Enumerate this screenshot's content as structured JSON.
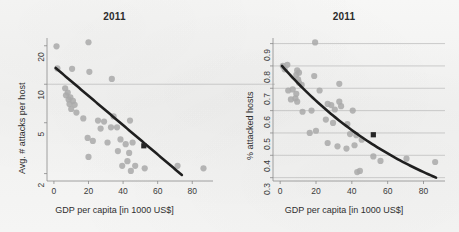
{
  "figure": {
    "width": 459,
    "height": 232,
    "background_color": "#f4f4f3",
    "point_color": "#a9a9a9",
    "line_color": "#1f1f1f",
    "grid_color": "#b9b9b9",
    "axis_color": "#8a8a8a",
    "marker_color": "#262626"
  },
  "chart_data": [
    {
      "panel": "left",
      "type": "scatter",
      "title": "2011",
      "xlabel": "GDP per capita [in 1000 US$]",
      "ylabel": "Avg. # attacks per host",
      "xlim": [
        -4,
        92
      ],
      "ylim": [
        1.75,
        23
      ],
      "yscale": "log",
      "xscale": "linear",
      "xticks": [
        0,
        20,
        40,
        60,
        80
      ],
      "yticks": [
        2,
        5,
        10,
        20
      ],
      "grid": "horizontal-at-10",
      "legend": "none",
      "points": [
        {
          "x": 1.5,
          "y": 19.8
        },
        {
          "x": 20.0,
          "y": 21.3
        },
        {
          "x": 2.0,
          "y": 13.3
        },
        {
          "x": 10.5,
          "y": 13.2
        },
        {
          "x": 20.5,
          "y": 12.5
        },
        {
          "x": 33.5,
          "y": 11.0
        },
        {
          "x": 6.5,
          "y": 9.3
        },
        {
          "x": 8.0,
          "y": 8.6
        },
        {
          "x": 7.0,
          "y": 8.2
        },
        {
          "x": 8.5,
          "y": 7.6
        },
        {
          "x": 9.5,
          "y": 7.9
        },
        {
          "x": 11.0,
          "y": 7.4
        },
        {
          "x": 9.0,
          "y": 7.0
        },
        {
          "x": 12.0,
          "y": 6.9
        },
        {
          "x": 10.0,
          "y": 6.4
        },
        {
          "x": 13.0,
          "y": 6.0
        },
        {
          "x": 17.0,
          "y": 5.4
        },
        {
          "x": 25.5,
          "y": 5.2
        },
        {
          "x": 29.0,
          "y": 5.1
        },
        {
          "x": 34.5,
          "y": 5.6
        },
        {
          "x": 44.0,
          "y": 5.2
        },
        {
          "x": 27.0,
          "y": 4.5
        },
        {
          "x": 33.0,
          "y": 4.6
        },
        {
          "x": 36.5,
          "y": 4.6
        },
        {
          "x": 19.5,
          "y": 3.8
        },
        {
          "x": 22.5,
          "y": 3.6
        },
        {
          "x": 31.0,
          "y": 3.5
        },
        {
          "x": 38.5,
          "y": 3.7
        },
        {
          "x": 41.5,
          "y": 3.4
        },
        {
          "x": 45.5,
          "y": 3.5
        },
        {
          "x": 37.0,
          "y": 3.0
        },
        {
          "x": 43.5,
          "y": 2.9
        },
        {
          "x": 20.0,
          "y": 2.7
        },
        {
          "x": 42.5,
          "y": 2.5
        },
        {
          "x": 47.0,
          "y": 2.3
        },
        {
          "x": 39.5,
          "y": 2.3
        },
        {
          "x": 44.5,
          "y": 2.1
        },
        {
          "x": 52.5,
          "y": 2.2
        },
        {
          "x": 71.5,
          "y": 2.3
        },
        {
          "x": 86.5,
          "y": 2.2
        }
      ],
      "trend_line": {
        "type": "log-linear-fit",
        "x_start": 1.0,
        "y_start": 13.4,
        "x_end": 74.0,
        "y_end": 1.95
      },
      "highlight_marker": {
        "shape": "square",
        "x": 52.0,
        "y": 3.3,
        "label": ""
      }
    },
    {
      "panel": "right",
      "type": "scatter",
      "title": "2011",
      "xlabel": "GDP per capita [in 1000 US$]",
      "ylabel": "% attacked hosts",
      "xlim": [
        -4,
        92
      ],
      "ylim": [
        0.285,
        0.925
      ],
      "yscale": "linear",
      "xscale": "linear",
      "xticks": [
        0,
        20,
        40,
        60,
        80
      ],
      "yticks": [
        0.3,
        0.4,
        0.5,
        0.6,
        0.7,
        0.8,
        0.9
      ],
      "grid": "horizontal",
      "legend": "none",
      "points": [
        {
          "x": 19.5,
          "y": 0.905
        },
        {
          "x": 1.5,
          "y": 0.8
        },
        {
          "x": 4.0,
          "y": 0.805
        },
        {
          "x": 2.5,
          "y": 0.785
        },
        {
          "x": 9.5,
          "y": 0.78
        },
        {
          "x": 10.5,
          "y": 0.77
        },
        {
          "x": 9.0,
          "y": 0.76
        },
        {
          "x": 19.0,
          "y": 0.755
        },
        {
          "x": 10.0,
          "y": 0.74
        },
        {
          "x": 10.5,
          "y": 0.725
        },
        {
          "x": 12.0,
          "y": 0.715
        },
        {
          "x": 33.0,
          "y": 0.72
        },
        {
          "x": 4.5,
          "y": 0.69
        },
        {
          "x": 7.0,
          "y": 0.695
        },
        {
          "x": 22.0,
          "y": 0.69
        },
        {
          "x": 9.0,
          "y": 0.675
        },
        {
          "x": 8.5,
          "y": 0.655
        },
        {
          "x": 6.0,
          "y": 0.65
        },
        {
          "x": 9.5,
          "y": 0.64
        },
        {
          "x": 26.5,
          "y": 0.63
        },
        {
          "x": 28.5,
          "y": 0.625
        },
        {
          "x": 33.0,
          "y": 0.64
        },
        {
          "x": 34.0,
          "y": 0.62
        },
        {
          "x": 30.5,
          "y": 0.605
        },
        {
          "x": 40.5,
          "y": 0.6
        },
        {
          "x": 12.5,
          "y": 0.595
        },
        {
          "x": 17.5,
          "y": 0.6
        },
        {
          "x": 25.5,
          "y": 0.56
        },
        {
          "x": 29.5,
          "y": 0.545
        },
        {
          "x": 37.5,
          "y": 0.54
        },
        {
          "x": 20.0,
          "y": 0.51
        },
        {
          "x": 16.5,
          "y": 0.5
        },
        {
          "x": 39.0,
          "y": 0.495
        },
        {
          "x": 42.5,
          "y": 0.49
        },
        {
          "x": 45.5,
          "y": 0.47
        },
        {
          "x": 26.5,
          "y": 0.455
        },
        {
          "x": 32.0,
          "y": 0.44
        },
        {
          "x": 37.0,
          "y": 0.43
        },
        {
          "x": 41.5,
          "y": 0.445
        },
        {
          "x": 52.0,
          "y": 0.395
        },
        {
          "x": 56.0,
          "y": 0.375
        },
        {
          "x": 70.5,
          "y": 0.385
        },
        {
          "x": 86.5,
          "y": 0.37
        },
        {
          "x": 43.0,
          "y": 0.325
        },
        {
          "x": 44.5,
          "y": 0.33
        }
      ],
      "trend_line": {
        "type": "exponential-decay-fit",
        "x_start": 1.0,
        "y_start": 0.8,
        "x_end": 87.0,
        "y_end": 0.3
      },
      "highlight_marker": {
        "shape": "square",
        "x": 52.0,
        "y": 0.492,
        "label": ""
      }
    }
  ]
}
